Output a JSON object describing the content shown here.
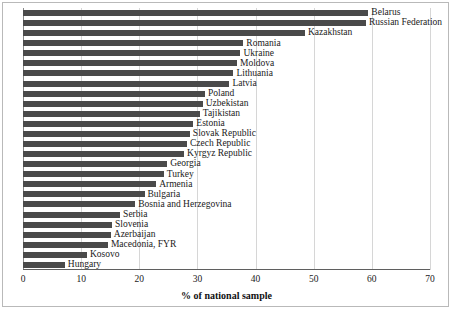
{
  "chart_data": {
    "type": "bar",
    "orientation": "horizontal",
    "title": "",
    "xlabel": "% of national sample",
    "ylabel": "",
    "xlim": [
      0,
      70
    ],
    "xticks": [
      0,
      10,
      20,
      30,
      40,
      50,
      60,
      70
    ],
    "xtick_labels": [
      "0",
      "10",
      "20",
      "30",
      "40",
      "50",
      "60",
      "70"
    ],
    "grid": true,
    "grid_axis": "x",
    "legend": "none",
    "bar_color": "#4a4a4a",
    "categories": [
      "Belarus",
      "Russian Federation",
      "Kazakhstan",
      "Romania",
      "Ukraine",
      "Moldova",
      "Lithuania",
      "Latvia",
      "Poland",
      "Uzbekistan",
      "Tajikistan",
      "Estonia",
      "Slovak Republic",
      "Czech Republic",
      "Kyrgyz Republic",
      "Georgia",
      "Turkey",
      "Armenia",
      "Bulgaria",
      "Bosnia and Herzegovina",
      "Serbia",
      "Slovenia",
      "Azerbaijan",
      "Macedonia, FYR",
      "Kosovo",
      "Hungary"
    ],
    "values": [
      59.4,
      59.0,
      48.5,
      37.9,
      37.4,
      36.8,
      36.2,
      35.5,
      31.3,
      30.9,
      30.4,
      29.3,
      28.7,
      28.2,
      27.7,
      24.8,
      24.2,
      22.9,
      20.9,
      19.3,
      16.7,
      15.3,
      15.1,
      14.6,
      11.0,
      7.2
    ]
  }
}
